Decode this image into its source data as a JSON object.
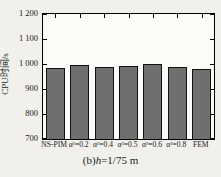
{
  "figure": {
    "caption_prefix": "(b)",
    "caption_var": "h",
    "caption_rest": "=1/75 m"
  },
  "chart_data": {
    "type": "bar",
    "title": "",
    "categories": [
      "NS-PIM",
      "α²=0.2",
      "α²=0.4",
      "α²=0.5",
      "α²=0.6",
      "α²=0.8",
      "FEM"
    ],
    "values": [
      983,
      995,
      987,
      992,
      1000,
      990,
      980
    ],
    "xlabel": "",
    "ylabel": "CPU时间/s",
    "ylim": [
      700,
      1200
    ],
    "ytick_values": [
      700,
      800,
      900,
      1000,
      1100,
      1200
    ],
    "ytick_labels": [
      "700",
      "800",
      "900",
      "1 000",
      "1 100",
      "1 200"
    ],
    "grid": false,
    "legend": null,
    "bar_color": "#6f6f6f",
    "bar_edge_color": "#111111",
    "plot_bg_color": "#fbfbf8",
    "page_bg_color": "#f1f0ec"
  }
}
